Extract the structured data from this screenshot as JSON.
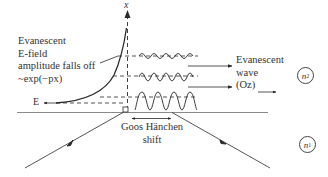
{
  "figure": {
    "axis_label": "x",
    "left_annotation": {
      "lines": [
        "Evanescent",
        "E-field",
        "amplitude falls off",
        "~exp(−px)"
      ]
    },
    "field_label": "E",
    "right_annotation": {
      "lines": [
        "Evanescent",
        "wave",
        "(Oz)"
      ]
    },
    "shift_label": {
      "lines": [
        "Goos Hänchen",
        "shift"
      ]
    },
    "media": [
      {
        "symbol": "n",
        "subscript": "2",
        "region": "upper"
      },
      {
        "symbol": "n",
        "subscript": "1",
        "region": "lower"
      }
    ],
    "colors": {
      "line": "#2a2a2a",
      "interface": "#888888",
      "background": "#ffffff"
    }
  }
}
